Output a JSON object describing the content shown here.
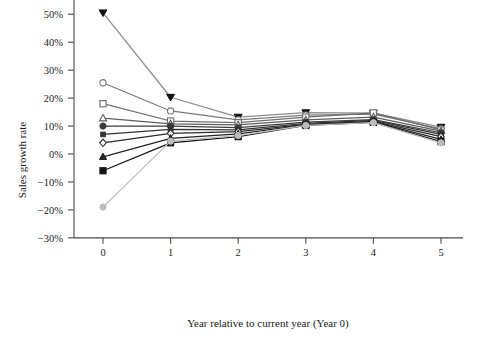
{
  "chart_data": {
    "type": "line",
    "title": "",
    "xlabel": "Year relative to current year (Year 0)",
    "ylabel": "Sales growth rate",
    "x": [
      0,
      1,
      2,
      3,
      4,
      5
    ],
    "xtick_labels": [
      "0",
      "1",
      "2",
      "3",
      "4",
      "5"
    ],
    "xlim": [
      -0.45,
      5.45
    ],
    "ytick_labels": [
      "50%",
      "40%",
      "30%",
      "20%",
      "10%",
      "0%",
      "-10%",
      "-20%",
      "-30%"
    ],
    "ytick_values": [
      50,
      40,
      30,
      20,
      10,
      0,
      -10,
      -20,
      -30
    ],
    "ylim": [
      -30,
      55
    ],
    "yunit": "percent",
    "grid": false,
    "legend": "none",
    "series": [
      {
        "name": "decile-1-highest",
        "marker": "triangle-down-filled",
        "color": "#8c8c8c",
        "values": [
          50.5,
          20.3,
          13.2,
          14.8,
          14.6,
          9.6
        ]
      },
      {
        "name": "decile-2",
        "marker": "circle-open",
        "color": "#7a7a7a",
        "values": [
          25.5,
          15.4,
          12.2,
          13.9,
          14.3,
          9.0
        ]
      },
      {
        "name": "decile-3",
        "marker": "square-open",
        "color": "#6e6e6e",
        "values": [
          18.0,
          11.8,
          11.2,
          13.2,
          14.7,
          8.6
        ]
      },
      {
        "name": "decile-4",
        "marker": "triangle-up-open",
        "color": "#5f5f5f",
        "values": [
          12.8,
          10.8,
          10.4,
          12.2,
          13.2,
          8.2
        ]
      },
      {
        "name": "decile-5",
        "marker": "circle-filled",
        "color": "#3c3c3c",
        "values": [
          10.0,
          10.0,
          9.4,
          11.4,
          12.3,
          7.6
        ]
      },
      {
        "name": "decile-6",
        "marker": "square-small-filled",
        "color": "#333333",
        "values": [
          7.0,
          8.8,
          8.6,
          11.0,
          12.0,
          7.0
        ]
      },
      {
        "name": "decile-7",
        "marker": "diamond-open",
        "color": "#2b2b2b",
        "values": [
          4.0,
          7.4,
          8.0,
          10.6,
          11.7,
          6.2
        ]
      },
      {
        "name": "decile-8",
        "marker": "triangle-up-filled",
        "color": "#232323",
        "values": [
          -1.0,
          5.6,
          7.2,
          10.4,
          11.5,
          5.2
        ]
      },
      {
        "name": "decile-9",
        "marker": "square-filled",
        "color": "#141414",
        "values": [
          -6.0,
          4.0,
          6.2,
          10.2,
          11.3,
          4.4
        ]
      },
      {
        "name": "decile-10-lowest",
        "marker": "circle-filled",
        "color": "#bdbdbd",
        "values": [
          -19.0,
          4.6,
          6.6,
          10.2,
          11.2,
          4.0
        ]
      }
    ]
  }
}
